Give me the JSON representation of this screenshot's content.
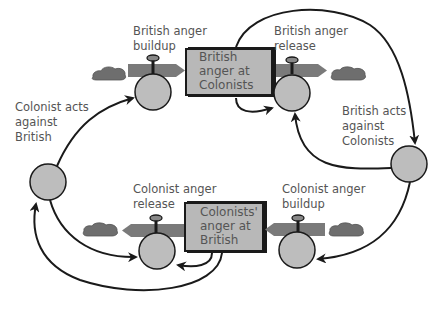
{
  "diagram": {
    "type": "stock-and-flow",
    "colors": {
      "background": "#ffffff",
      "stroke": "#1a1a1a",
      "stock_fill": "#b8b8b8",
      "circle_fill": "#bdbdbd",
      "pipe_fill": "#7a7a7a",
      "cloud_fill": "#6e6e6e",
      "label_text": "#555555"
    },
    "stocks": [
      {
        "id": "british-anger",
        "label_lines": [
          "British",
          "anger at",
          "Colonists"
        ]
      },
      {
        "id": "colonist-anger",
        "label_lines": [
          "Colonists'",
          "anger at",
          "British"
        ]
      }
    ],
    "flows": [
      {
        "id": "british-buildup",
        "label_lines": [
          "British anger",
          "buildup"
        ],
        "direction": "into british-anger"
      },
      {
        "id": "british-release",
        "label_lines": [
          "British anger",
          "release"
        ],
        "direction": "out of british-anger"
      },
      {
        "id": "colonist-release",
        "label_lines": [
          "Colonist anger",
          "release"
        ],
        "direction": "out of colonist-anger"
      },
      {
        "id": "colonist-buildup",
        "label_lines": [
          "Colonist anger",
          "buildup"
        ],
        "direction": "into colonist-anger"
      }
    ],
    "auxiliaries": [
      {
        "id": "colonist-acts",
        "label_lines": [
          "Colonist acts",
          "against",
          "British"
        ]
      },
      {
        "id": "british-acts",
        "label_lines": [
          "British acts",
          "against",
          "Colonists"
        ]
      }
    ],
    "links": [
      {
        "from": "colonist-acts",
        "to": "british-buildup"
      },
      {
        "from": "british-anger",
        "to": "british-release"
      },
      {
        "from": "british-anger",
        "to": "british-acts"
      },
      {
        "from": "british-acts",
        "to": "british-release"
      },
      {
        "from": "british-acts",
        "to": "colonist-buildup"
      },
      {
        "from": "colonist-acts",
        "to": "colonist-release"
      },
      {
        "from": "colonist-anger",
        "to": "colonist-release"
      },
      {
        "from": "colonist-anger",
        "to": "colonist-acts"
      }
    ]
  }
}
